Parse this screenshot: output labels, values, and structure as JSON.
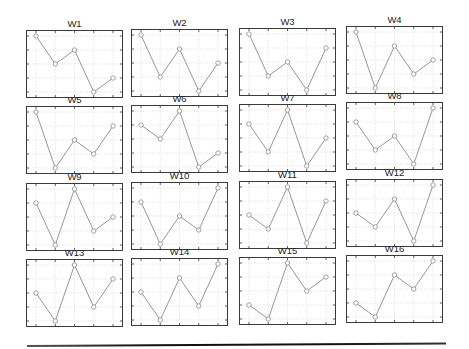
{
  "figure": {
    "rows": 4,
    "cols": 4,
    "colors": {
      "frame": "#3a3a3a",
      "grid": "#d6d6d6",
      "line": "#8a8a8a",
      "marker": "#8a8a8a",
      "text": "#222222"
    }
  },
  "chart_data": [
    {
      "type": "line",
      "title": "W1",
      "x": [
        1,
        2,
        3,
        4,
        5
      ],
      "values": [
        4,
        2,
        3,
        0,
        1
      ],
      "ylim": [
        0,
        4
      ],
      "grid": true,
      "marker": "circle"
    },
    {
      "type": "line",
      "title": "W2",
      "x": [
        1,
        2,
        3,
        4,
        5
      ],
      "values": [
        4,
        1,
        3,
        0,
        2
      ],
      "ylim": [
        0,
        4
      ],
      "grid": true,
      "marker": "circle"
    },
    {
      "type": "line",
      "title": "W3",
      "x": [
        1,
        2,
        3,
        4,
        5
      ],
      "values": [
        4,
        1,
        2,
        0,
        3
      ],
      "ylim": [
        0,
        4
      ],
      "grid": true,
      "marker": "circle"
    },
    {
      "type": "line",
      "title": "W4",
      "x": [
        1,
        2,
        3,
        4,
        5
      ],
      "values": [
        4,
        0,
        3,
        1,
        2
      ],
      "ylim": [
        0,
        4
      ],
      "grid": true,
      "marker": "circle"
    },
    {
      "type": "line",
      "title": "W5",
      "x": [
        1,
        2,
        3,
        4,
        5
      ],
      "values": [
        4,
        0,
        2,
        1,
        3
      ],
      "ylim": [
        0,
        4
      ],
      "grid": true,
      "marker": "circle"
    },
    {
      "type": "line",
      "title": "W6",
      "x": [
        1,
        2,
        3,
        4,
        5
      ],
      "values": [
        3,
        2,
        4,
        0,
        1
      ],
      "ylim": [
        0,
        4
      ],
      "grid": true,
      "marker": "circle"
    },
    {
      "type": "line",
      "title": "W7",
      "x": [
        1,
        2,
        3,
        4,
        5
      ],
      "values": [
        3,
        1,
        4,
        0,
        2
      ],
      "ylim": [
        0,
        4
      ],
      "grid": true,
      "marker": "circle"
    },
    {
      "type": "line",
      "title": "W8",
      "x": [
        1,
        2,
        3,
        4,
        5
      ],
      "values": [
        3,
        1,
        2,
        0,
        4
      ],
      "ylim": [
        0,
        4
      ],
      "grid": true,
      "marker": "circle"
    },
    {
      "type": "line",
      "title": "W9",
      "x": [
        1,
        2,
        3,
        4,
        5
      ],
      "values": [
        3,
        0,
        4,
        1,
        2
      ],
      "ylim": [
        0,
        4
      ],
      "grid": true,
      "marker": "circle"
    },
    {
      "type": "line",
      "title": "W10",
      "x": [
        1,
        2,
        3,
        4,
        5
      ],
      "values": [
        3,
        0,
        2,
        1,
        4
      ],
      "ylim": [
        0,
        4
      ],
      "grid": true,
      "marker": "circle"
    },
    {
      "type": "line",
      "title": "W11",
      "x": [
        1,
        2,
        3,
        4,
        5
      ],
      "values": [
        2,
        1,
        4,
        0,
        3
      ],
      "ylim": [
        0,
        4
      ],
      "grid": true,
      "marker": "circle"
    },
    {
      "type": "line",
      "title": "W12",
      "x": [
        1,
        2,
        3,
        4,
        5
      ],
      "values": [
        2,
        1,
        3,
        0,
        4
      ],
      "ylim": [
        0,
        4
      ],
      "grid": true,
      "marker": "circle"
    },
    {
      "type": "line",
      "title": "W13",
      "x": [
        1,
        2,
        3,
        4,
        5
      ],
      "values": [
        2,
        0,
        4,
        1,
        3
      ],
      "ylim": [
        0,
        4
      ],
      "grid": true,
      "marker": "circle"
    },
    {
      "type": "line",
      "title": "W14",
      "x": [
        1,
        2,
        3,
        4,
        5
      ],
      "values": [
        2,
        0,
        3,
        1,
        4
      ],
      "ylim": [
        0,
        4
      ],
      "grid": true,
      "marker": "circle"
    },
    {
      "type": "line",
      "title": "W15",
      "x": [
        1,
        2,
        3,
        4,
        5
      ],
      "values": [
        1,
        0,
        4,
        2,
        3
      ],
      "ylim": [
        0,
        4
      ],
      "grid": true,
      "marker": "circle"
    },
    {
      "type": "line",
      "title": "W16",
      "x": [
        1,
        2,
        3,
        4,
        5
      ],
      "values": [
        1,
        0,
        3,
        2,
        4
      ],
      "ylim": [
        0,
        4
      ],
      "grid": true,
      "marker": "circle"
    }
  ]
}
